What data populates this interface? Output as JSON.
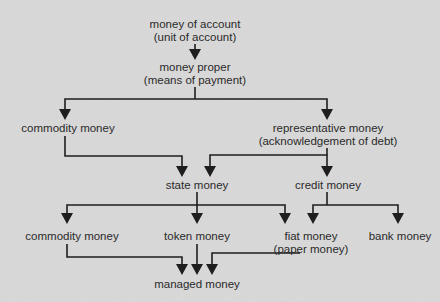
{
  "diagram": {
    "colors": {
      "background": "#dadada",
      "line": "#1e1e1e",
      "text": "#2a2a2a"
    },
    "nodes": {
      "money_of_account": {
        "line1": "money of account",
        "line2": "(unit of account)"
      },
      "money_proper": {
        "line1": "money proper",
        "line2": "(means of payment)"
      },
      "commodity_money_1": {
        "line1": "commodity money"
      },
      "representative_money": {
        "line1": "representative money",
        "line2": "(acknowledgement of debt)"
      },
      "state_money": {
        "line1": "state money"
      },
      "credit_money": {
        "line1": "credit money"
      },
      "commodity_money_2": {
        "line1": "commodity money"
      },
      "token_money": {
        "line1": "token money"
      },
      "fiat_money": {
        "line1": "fiat money",
        "line2": "(paper money)"
      },
      "bank_money": {
        "line1": "bank money"
      },
      "managed_money": {
        "line1": "managed money"
      }
    },
    "edges": [
      [
        "money_of_account",
        "money_proper"
      ],
      [
        "money_proper",
        "commodity_money_1"
      ],
      [
        "money_proper",
        "representative_money"
      ],
      [
        "commodity_money_1",
        "state_money"
      ],
      [
        "representative_money",
        "state_money"
      ],
      [
        "representative_money",
        "credit_money"
      ],
      [
        "state_money",
        "commodity_money_2"
      ],
      [
        "state_money",
        "token_money"
      ],
      [
        "state_money",
        "fiat_money"
      ],
      [
        "credit_money",
        "fiat_money"
      ],
      [
        "credit_money",
        "bank_money"
      ],
      [
        "commodity_money_2",
        "managed_money"
      ],
      [
        "token_money",
        "managed_money"
      ],
      [
        "fiat_money",
        "managed_money"
      ]
    ]
  }
}
